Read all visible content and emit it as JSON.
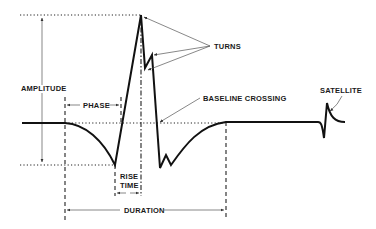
{
  "diagram": {
    "labels": {
      "turns": "TURNS",
      "amplitude": "AMPLITUDE",
      "phase": "PHASE",
      "baseline_crossing": "BASELINE CROSSING",
      "satellite": "SATELLITE",
      "rise": "RISE",
      "time": "TIME",
      "duration": "DURATION"
    },
    "colors": {
      "line": "#111111",
      "background": "#ffffff"
    }
  }
}
